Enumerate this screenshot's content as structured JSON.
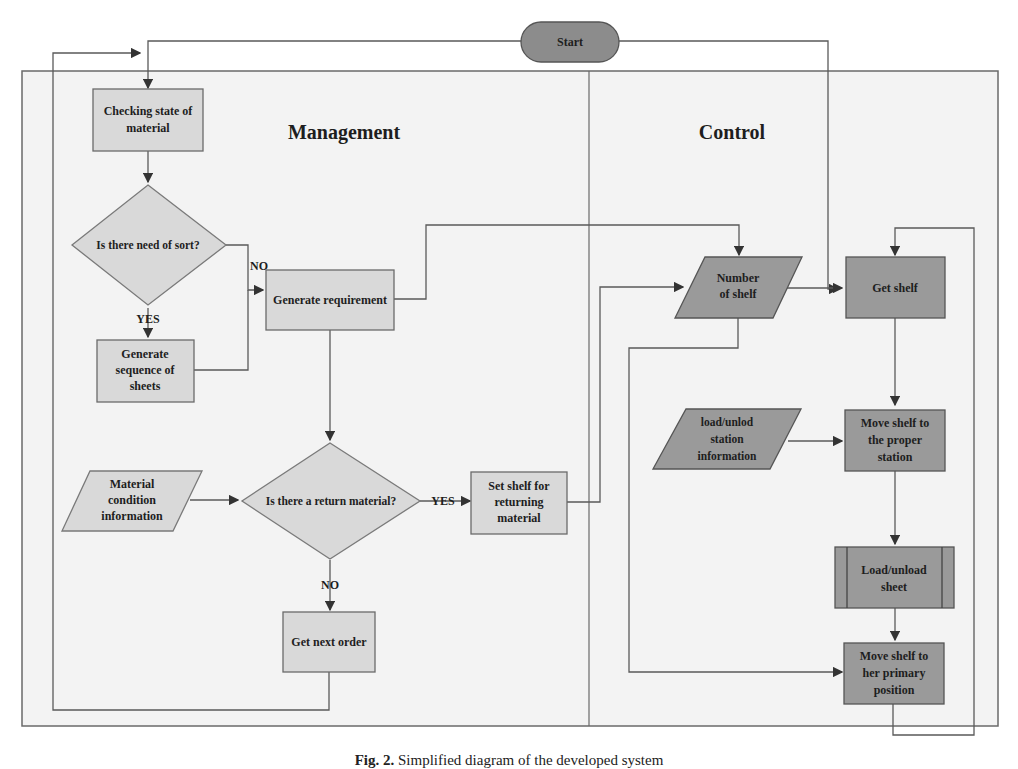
{
  "diagram": {
    "start": "Start",
    "lanes": {
      "management": "Management",
      "control": "Control"
    },
    "nodes": {
      "checking": [
        "Checking state of",
        "material"
      ],
      "need_sort": "Is there need of sort?",
      "gen_seq": [
        "Generate",
        "sequence of",
        "sheets"
      ],
      "gen_req": "Generate requirement",
      "mat_cond": [
        "Material",
        "condition",
        "information"
      ],
      "return_q": "Is there a return material?",
      "set_shelf": [
        "Set shelf for",
        "returning",
        "material"
      ],
      "next_order": "Get next order",
      "num_shelf": [
        "Number",
        "of shelf"
      ],
      "get_shelf": "Get shelf",
      "station_info": [
        "load/unlod",
        "station",
        "information"
      ],
      "move_proper": [
        "Move shelf to",
        "the proper",
        "station"
      ],
      "load_sheet": [
        "Load/unload",
        "sheet"
      ],
      "move_primary": [
        "Move shelf to",
        "her primary",
        "position"
      ]
    },
    "edge_labels": {
      "yes": "YES",
      "no": "NO"
    },
    "colors": {
      "light_fill": "#d9d9d9",
      "dark_fill": "#9a9a9a",
      "lane_bg": "#f3f3f3",
      "line": "#5a5a5a"
    }
  },
  "caption": {
    "prefix": "Fig. 2.",
    "text": "Simplified diagram of the developed system"
  }
}
